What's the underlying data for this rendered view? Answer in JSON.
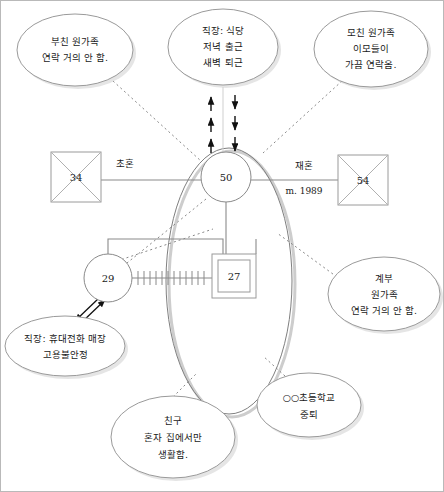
{
  "page": {
    "background": "#ffffff",
    "border_color": "#b9b9b9",
    "line_color": "#8a8a8a",
    "arrow_color": "#111111",
    "bubble_stroke": "#9a9a9a",
    "shadow_color": "#c9c9c9"
  },
  "persons": [
    {
      "id": "father",
      "label": "34",
      "shape": "square",
      "deceased": true,
      "x": 75,
      "y": 176,
      "size": 50
    },
    {
      "id": "mother",
      "label": "50",
      "shape": "circle",
      "deceased": false,
      "x": 225,
      "y": 176,
      "r": 25
    },
    {
      "id": "stepfather",
      "label": "54",
      "shape": "square",
      "deceased": true,
      "x": 362,
      "y": 179,
      "size": 50
    },
    {
      "id": "daughter",
      "label": "29",
      "shape": "circle",
      "deceased": false,
      "x": 107,
      "y": 277,
      "r": 24
    },
    {
      "id": "index-person",
      "label": "27",
      "shape": "double-square",
      "deceased": false,
      "x": 233,
      "y": 275,
      "size": 44
    }
  ],
  "relationship_labels": {
    "first_marriage": "초혼",
    "remarriage": "재혼",
    "marriage_year": "m. 1989"
  },
  "notes": [
    {
      "id": "paternal-family-note",
      "lines": [
        "부친 원가족",
        "연락 거의 안 함."
      ],
      "cx": 74,
      "cy": 49,
      "rx": 58,
      "ry": 36
    },
    {
      "id": "mother-work-note",
      "lines": [
        "직장: 식당",
        "저녁 출근",
        "새벽 퇴근"
      ],
      "cx": 222,
      "cy": 46,
      "rx": 55,
      "ry": 38
    },
    {
      "id": "maternal-family-note",
      "lines": [
        "모친 원가족",
        "이모들이",
        "가끔 연락옴."
      ],
      "cx": 370,
      "cy": 48,
      "rx": 57,
      "ry": 38
    },
    {
      "id": "stepfather-family-note",
      "lines": [
        "계부",
        "원가족",
        "연락 거의 안 함."
      ],
      "cx": 383,
      "cy": 293,
      "rx": 56,
      "ry": 37
    },
    {
      "id": "daughter-work-note",
      "lines": [
        "직장: 휴대전화 매장",
        "고용불안정"
      ],
      "cx": 64,
      "cy": 345,
      "rx": 60,
      "ry": 30
    },
    {
      "id": "friend-note",
      "lines": [
        "친구",
        "혼자 집에서만",
        "생활함."
      ],
      "cx": 172,
      "cy": 436,
      "rx": 62,
      "ry": 41
    },
    {
      "id": "school-note",
      "lines": [
        "○○초등학교",
        "중퇴"
      ],
      "cx": 308,
      "cy": 404,
      "rx": 52,
      "ry": 32
    }
  ],
  "household": {
    "id": "household-boundary",
    "cx": 228,
    "cy": 280,
    "rx": 63,
    "ry": 133
  }
}
